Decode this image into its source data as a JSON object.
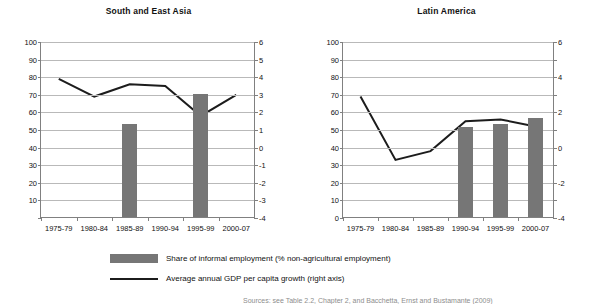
{
  "legend": {
    "bar_label": "Share of informal employment (% non-agricultural employment)",
    "line_label": "Average annual GDP per capita growth (right axis)",
    "bar_color": "#767676",
    "line_color": "#1c1c1c"
  },
  "source_note": "Sources: see Table 2.2, Chapter 2, and Bacchetta, Ernst and Bustamante (2009)",
  "chart_data": [
    {
      "type": "bar",
      "title": "South and East Asia",
      "xlabel": "",
      "ylabel": "",
      "y2label": "",
      "categories": [
        "1975-79",
        "1980-84",
        "1985-89",
        "1990-94",
        "1995-99",
        "2000-07"
      ],
      "ylim": [
        0,
        100
      ],
      "yticks": [
        0,
        10,
        20,
        30,
        40,
        50,
        60,
        70,
        80,
        90,
        100
      ],
      "ytick_labels": [
        "",
        "10",
        "20",
        "30",
        "40",
        "50",
        "60",
        "70",
        "80",
        "90",
        "100"
      ],
      "y2lim": [
        -4,
        6
      ],
      "y2ticks": [
        -4,
        -3,
        -2,
        -1,
        0,
        1,
        2,
        3,
        4,
        5,
        6
      ],
      "y2tick_labels": [
        "-4",
        "-3",
        "-2",
        "-1",
        "0",
        "1",
        "2",
        "3",
        "4",
        "5",
        "6"
      ],
      "grid": true,
      "legend_position": "bottom",
      "series": [
        {
          "name": "Share of informal employment (% non-agricultural employment)",
          "type": "bar",
          "axis": "left",
          "values": [
            null,
            null,
            53,
            null,
            70,
            null
          ]
        },
        {
          "name": "Average annual GDP per capita growth (right axis)",
          "type": "line",
          "axis": "right",
          "values": [
            3.9,
            2.9,
            3.6,
            3.5,
            1.8,
            3.0
          ]
        }
      ]
    },
    {
      "type": "bar",
      "title": "Latin America",
      "xlabel": "",
      "ylabel": "",
      "y2label": "",
      "categories": [
        "1975-79",
        "1980-84",
        "1985-89",
        "1990-94",
        "1995-99",
        "2000-07"
      ],
      "ylim": [
        0,
        100
      ],
      "yticks": [
        0,
        10,
        20,
        30,
        40,
        50,
        60,
        70,
        80,
        90,
        100
      ],
      "ytick_labels": [
        "0",
        "10",
        "20",
        "30",
        "40",
        "50",
        "60",
        "70",
        "80",
        "90",
        "100"
      ],
      "y2lim": [
        -4,
        6
      ],
      "y2ticks": [
        -4,
        -3,
        -2,
        -1,
        0,
        1,
        2,
        3,
        4,
        5,
        6
      ],
      "y2tick_labels": [
        "-4",
        "",
        "-2",
        "",
        "0",
        "",
        "2",
        "",
        "4",
        "",
        "6"
      ],
      "grid": true,
      "legend_position": "bottom",
      "series": [
        {
          "name": "Share of informal employment (% non-agricultural employment)",
          "type": "bar",
          "axis": "left",
          "values": [
            null,
            null,
            null,
            51,
            53,
            56
          ]
        },
        {
          "name": "Average annual GDP per capita growth (right axis)",
          "type": "line",
          "axis": "right",
          "values": [
            2.9,
            -0.7,
            -0.2,
            1.5,
            1.6,
            1.2
          ]
        }
      ]
    }
  ]
}
